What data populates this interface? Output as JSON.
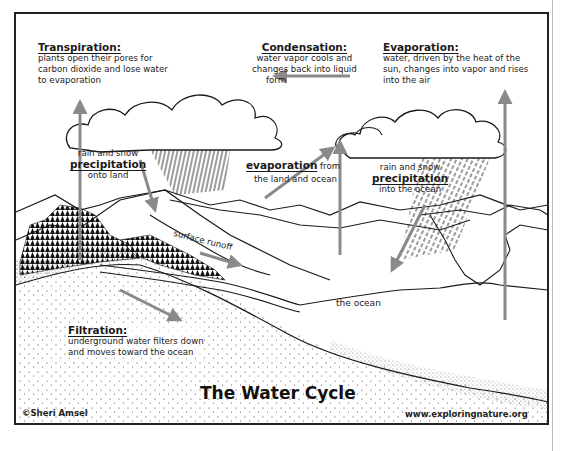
{
  "diagram": {
    "title": "The Water Cycle",
    "credit_left": "©Sheri Amsel",
    "credit_right": "www.exploringnature.org",
    "arrow_color": "#8a8a8a",
    "line_color": "#1a1a1a"
  },
  "labels": {
    "transpiration": {
      "heading": "Transpiration:",
      "lines": [
        "plants open their pores for",
        "carbon dioxide and lose water",
        "to evaporation"
      ]
    },
    "condensation": {
      "heading": "Condensation:",
      "lines": [
        "water vapor cools and",
        "changes back into liquid",
        "form"
      ]
    },
    "evaporation": {
      "heading": "Evaporation:",
      "lines": [
        "water, driven by the heat of the",
        "sun, changes into vapor and rises",
        "into the air"
      ]
    },
    "precipitation_land": {
      "pre": "rain and snow",
      "heading": "precipitation",
      "post": "onto land"
    },
    "evaporation_land_ocean": {
      "heading": "evaporation",
      "suffix": "from",
      "post": "the land and ocean"
    },
    "precipitation_ocean": {
      "pre": "rain and snow",
      "heading": "precipitation",
      "post": "into the ocean"
    },
    "surface_runoff": "surface runoff",
    "ocean": "the ocean",
    "filtration": {
      "heading": "Filtration:",
      "lines": [
        "underground water filters down",
        "and moves toward the ocean"
      ]
    }
  }
}
